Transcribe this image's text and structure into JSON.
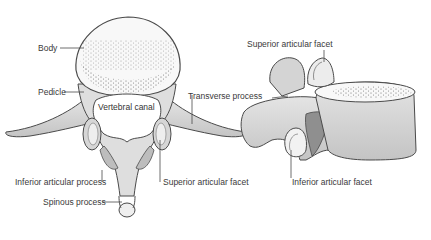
{
  "diagram": {
    "superior_view": {
      "labels": {
        "body": "Body",
        "pedicle": "Pedicle",
        "vertebral_canal": "Vertebral canal",
        "transverse_process": "Transverse process",
        "inferior_articular_process": "Inferior articular process",
        "superior_articular_facet": "Superior articular facet",
        "spinous_process": "Spinous process"
      }
    },
    "lateral_view": {
      "labels": {
        "superior_articular_facet": "Superior articular facet",
        "inferior_articular_facet": "Inferior articular facet"
      }
    },
    "colors": {
      "outline": "#4a4a4a",
      "bone_light": "#ececec",
      "bone_mid": "#cfcfcf",
      "bone_dark": "#8f8f8f",
      "label_text": "#3a3a3a"
    }
  }
}
